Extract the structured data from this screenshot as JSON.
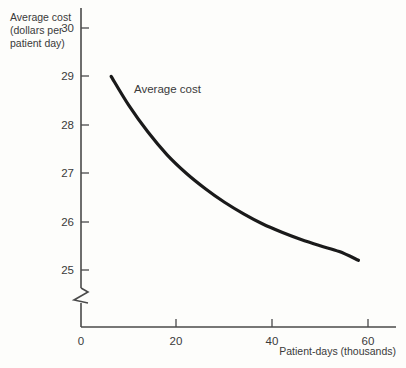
{
  "chart_data": {
    "type": "line",
    "title": "",
    "subtitle": "",
    "xlabel": "Patient-days (thousands)",
    "ylabel": "Average cost (dollars per patient day)",
    "ylabel_lines": [
      "Average cost",
      "(dollars per",
      "patient day)"
    ],
    "xlim": [
      0,
      66
    ],
    "ylim": [
      24.6,
      30.4
    ],
    "y_axis_break": true,
    "y_axis_break_note": "zigzag break between 0 and 25",
    "grid": false,
    "legend_position": "inline-annotation",
    "xticks": [
      0,
      20,
      40,
      60
    ],
    "xtick_labels": [
      "0",
      "20",
      "40",
      "60"
    ],
    "yticks": [
      25,
      26,
      27,
      28,
      29,
      30
    ],
    "ytick_labels": [
      "25",
      "26",
      "27",
      "28",
      "29",
      "30"
    ],
    "series": [
      {
        "name": "Average cost",
        "color": "#1a1a1a",
        "x": [
          6.3,
          10,
          14,
          18,
          22,
          26,
          30,
          34,
          38,
          42,
          46,
          50,
          54,
          58
        ],
        "values": [
          29.0,
          28.4,
          27.85,
          27.38,
          27.0,
          26.68,
          26.4,
          26.16,
          25.95,
          25.78,
          25.63,
          25.5,
          25.38,
          25.2
        ]
      }
    ],
    "annotations": [
      {
        "text": "Average cost",
        "x": 20,
        "y": 28.85
      }
    ]
  },
  "colors": {
    "curve": "#1a1a1a",
    "axis": "#4a4a4a",
    "text": "#3a3a3a",
    "background": "#fdfdfb"
  },
  "axis_labels": {
    "y_line_1": "Average cost",
    "y_line_2": "(dollars per",
    "y_line_3": "patient day)",
    "x_title": "Patient-days (thousands)"
  },
  "ticks": {
    "y": {
      "t30": "30",
      "t29": "29",
      "t28": "28",
      "t27": "27",
      "t26": "26",
      "t25": "25"
    },
    "x": {
      "t0": "0",
      "t20": "20",
      "t40": "40",
      "t60": "60"
    }
  },
  "series_label": "Average cost"
}
